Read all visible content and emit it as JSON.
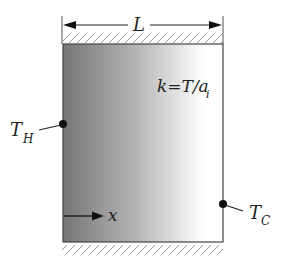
{
  "diagram": {
    "type": "heat-conduction-slab",
    "labels": {
      "length": "L",
      "equation": "k=T/a",
      "equation_subscript": "i",
      "hot_temp": "T",
      "hot_temp_subscript": "H",
      "cold_temp": "T",
      "cold_temp_subscript": "C",
      "axis": "x"
    },
    "colors": {
      "gradient_start": "#767676",
      "gradient_mid": "#b4b4b4",
      "gradient_end": "#ffffff",
      "stroke": "#333333",
      "hatch": "#9a9a9a"
    }
  }
}
